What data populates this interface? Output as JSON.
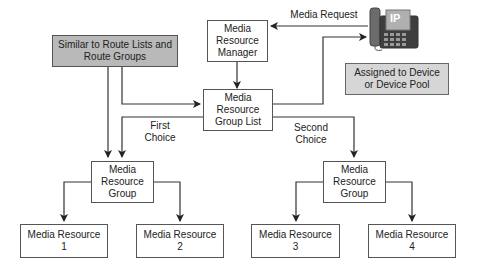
{
  "nodes": {
    "mrm": {
      "lines": [
        "Media",
        "Resource",
        "Manager"
      ]
    },
    "mrgl": {
      "lines": [
        "Media",
        "Resource",
        "Group List"
      ]
    },
    "similar": {
      "lines": [
        "Similar to Route Lists and",
        "Route Groups"
      ]
    },
    "assigned": {
      "lines": [
        "Assigned to Device",
        "or Device Pool"
      ]
    },
    "mrg_left": {
      "lines": [
        "Media",
        "Resource",
        "Group"
      ]
    },
    "mrg_right": {
      "lines": [
        "Media",
        "Resource",
        "Group"
      ]
    },
    "mr1": {
      "lines": [
        "Media Resource",
        "1"
      ]
    },
    "mr2": {
      "lines": [
        "Media Resource",
        "2"
      ]
    },
    "mr3": {
      "lines": [
        "Media Resource",
        "3"
      ]
    },
    "mr4": {
      "lines": [
        "Media Resource",
        "4"
      ]
    }
  },
  "edge_labels": {
    "media_request": "Media Request",
    "first_choice": [
      "First",
      "Choice"
    ],
    "second_choice": [
      "Second",
      "Choice"
    ]
  },
  "phone": {
    "badge": "IP"
  },
  "colors": {
    "line": "#333333",
    "gray_box": "#b9b9b9",
    "light_gray_box": "#d6d6d6",
    "phone_screen": "#b0b0b0"
  }
}
